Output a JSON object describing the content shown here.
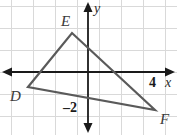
{
  "figure": {
    "width": 177,
    "height": 135,
    "background_color": "#ffffff"
  },
  "grid": {
    "line_color": "#d9d9d9",
    "cell_size_px": 22,
    "visible": true,
    "vertical_line_x": [
      11,
      33,
      55,
      77,
      99,
      121,
      143,
      165
    ],
    "horizontal_line_y": [
      6,
      28,
      50,
      72,
      94,
      116
    ]
  },
  "axes": {
    "color": "#1a1a1a",
    "x_axis": {
      "name": "x-axis",
      "label": "x",
      "y_px": 72,
      "arrow_left": true,
      "arrow_right": true
    },
    "y_axis": {
      "name": "y-axis",
      "label": "y",
      "x_px": 88,
      "arrow_up": true,
      "arrow_down": true
    },
    "tick_labels": [
      {
        "text": "4",
        "axis": "x",
        "value": 4
      },
      {
        "text": "–2",
        "axis": "y",
        "value": -2
      }
    ]
  },
  "triangle": {
    "name": "triangle-DEF",
    "stroke_color": "#5a5a5a",
    "stroke_width": 2.2,
    "fill": "none",
    "vertices": [
      {
        "label": "D",
        "x": -3,
        "y": -1,
        "px_x": 28,
        "px_y": 87
      },
      {
        "label": "E",
        "x": -1,
        "y": 2,
        "px_x": 72,
        "px_y": 33
      },
      {
        "label": "F",
        "x": 3,
        "y": -2,
        "px_x": 155,
        "px_y": 110
      }
    ],
    "edges": [
      "DE",
      "EF",
      "FD"
    ]
  },
  "labels": {
    "vertex_D": "D",
    "vertex_E": "E",
    "vertex_F": "F",
    "axis_x": "x",
    "axis_y": "y",
    "tick_x_4": "4",
    "tick_y_neg2": "–2"
  }
}
